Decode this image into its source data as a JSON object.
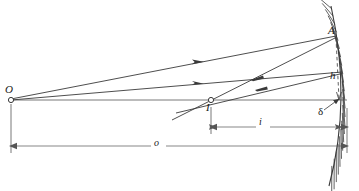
{
  "figure": {
    "stroke_color": "#3a3a3a",
    "label_color": "#1a1a1a",
    "background": "#ffffff"
  },
  "labels": {
    "object_point": "O",
    "image_point": "I",
    "mirror_point": "A",
    "height": "h",
    "sagitta": "δ",
    "image_distance": "i",
    "object_distance": "o"
  },
  "points": {
    "O": {
      "x": 11,
      "y": 100
    },
    "I": {
      "x": 211,
      "y": 100
    },
    "A": {
      "x": 336,
      "y": 36
    },
    "B": {
      "x": 342,
      "y": 72
    },
    "vertex": {
      "x": 347,
      "y": 100
    }
  },
  "dimensions": {
    "image_distance": {
      "from_x": 211,
      "to_x": 347,
      "y": 127,
      "label": "i"
    },
    "object_distance": {
      "from_x": 11,
      "to_x": 347,
      "y": 146,
      "label": "o"
    }
  },
  "icons": {
    "arrow_right": "ray-direction-incident",
    "arrow_left": "ray-direction-reflected",
    "hatching": "mirror-back-hatching",
    "dashed": "height-reference-dashed-line"
  }
}
